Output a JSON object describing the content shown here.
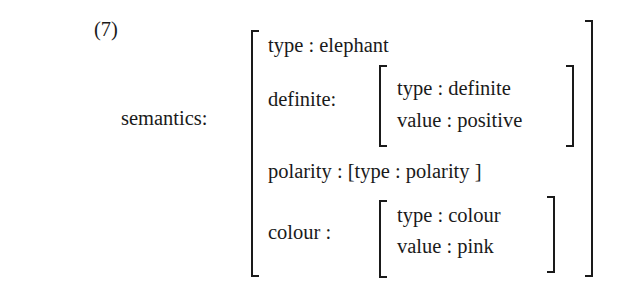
{
  "example": {
    "number": "(7)",
    "feature_label": "semantics:",
    "avm": {
      "rows": [
        {
          "attribute": "type",
          "separator": ":",
          "value": "elephant"
        },
        {
          "attribute": "definite:",
          "value": [
            {
              "attribute": "type",
              "separator": ":",
              "value": "definite"
            },
            {
              "attribute": "value",
              "separator": ":",
              "value": "positive"
            }
          ]
        },
        {
          "attribute": "polarity",
          "separator": ":",
          "value_text": "[type : polarity ]"
        },
        {
          "attribute": "colour :",
          "value": [
            {
              "attribute": "type",
              "separator": ":",
              "value": "colour"
            },
            {
              "attribute": "value",
              "separator": ":",
              "value": "pink"
            }
          ]
        }
      ]
    }
  },
  "text": {
    "row1": "type : elephant",
    "row2_label": "definite:",
    "row2_sub1": "type : definite",
    "row2_sub2": "value : positive",
    "row3": "polarity : [type : polarity ]",
    "row4_label": "colour :",
    "row4_sub1": "type : colour",
    "row4_sub2": "value : pink"
  }
}
